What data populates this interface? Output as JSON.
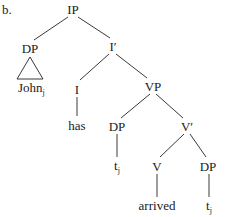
{
  "label": "b.",
  "nodes": {
    "ip": {
      "text": "IP"
    },
    "dp_subject": {
      "text": "DP"
    },
    "john": {
      "text": "John",
      "subscript": "j"
    },
    "i_bar": {
      "text": "I′"
    },
    "i_head": {
      "text": "I"
    },
    "has": {
      "text": "has"
    },
    "vp": {
      "text": "VP"
    },
    "dp_spec_vp": {
      "text": "DP"
    },
    "trace_spec": {
      "text": "t",
      "subscript": "j"
    },
    "v_bar": {
      "text": "V′"
    },
    "v_head": {
      "text": "V"
    },
    "arrived": {
      "text": "arrived"
    },
    "dp_object": {
      "text": "DP"
    },
    "trace_object": {
      "text": "t",
      "subscript": "j"
    }
  },
  "colors": {
    "text": "#1a1a1a",
    "lines": "#3a3a3a",
    "background": "#ffffff"
  }
}
